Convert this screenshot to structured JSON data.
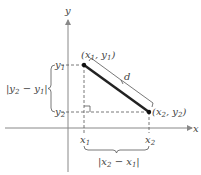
{
  "diagram": {
    "axes": {
      "x_label": "x",
      "y_label": "y"
    },
    "points": [
      {
        "name": "P1",
        "label": "(x1, y1)"
      },
      {
        "name": "P2",
        "label": "(x2, y2)"
      }
    ],
    "segment_label": "d",
    "tick_labels": {
      "x1": "x1",
      "x2": "x2",
      "y1": "y1",
      "y2": "y2"
    },
    "brace_labels": {
      "vertical": "|y2 − y1|",
      "horizontal": "|x2 − x1|"
    },
    "colors": {
      "axis": "#888888",
      "segment": "#222222",
      "dashed": "#555555",
      "text": "#444444"
    }
  }
}
